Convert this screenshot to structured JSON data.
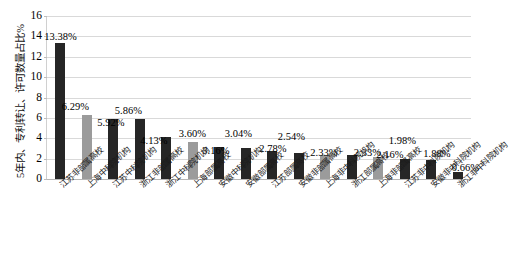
{
  "chart_data": {
    "type": "bar",
    "title": "",
    "subtitle": "",
    "xlabel": "",
    "ylabel": "5年内、专利转让、许可数量占比%",
    "ylim": [
      0,
      16
    ],
    "ytick_labels": [
      "0",
      "2",
      "4",
      "6",
      "8",
      "10",
      "12",
      "14",
      "16"
    ],
    "ytick_values": [
      0,
      2,
      4,
      6,
      8,
      10,
      12,
      14,
      16
    ],
    "grid": true,
    "legend": "none",
    "categories": [
      "江苏非部属高校",
      "上海中科院机构",
      "江苏中科院机构",
      "浙江非部属高校",
      "浙江中科院机构",
      "上海部属高校",
      "安徽中科院机构",
      "安徽部属高校",
      "江苏部属高校",
      "安徽非部属高校",
      "上海非中科院机构",
      "浙江部属高校",
      "上海非部属高校",
      "江苏非中科院机构",
      "安徽非中科院机构",
      "浙江非中科院机构"
    ],
    "values": [
      13.38,
      6.29,
      5.92,
      5.86,
      4.13,
      3.6,
      3.16,
      3.04,
      2.78,
      2.54,
      2.33,
      2.33,
      2.16,
      1.98,
      1.88,
      0.66
    ],
    "value_labels": [
      "13.38%",
      "6.29%",
      "5.92%",
      "5.86%",
      "4.13%",
      "3.60%",
      "3.16%",
      "3.04%",
      "2.78%",
      "2.54%",
      "2.33%",
      "2.33%",
      "2.16%",
      "1.98%",
      "1.88%",
      "0.66%"
    ],
    "bar_colors": [
      "#262626",
      "#9b9b9b",
      "#262626",
      "#262626",
      "#262626",
      "#9b9b9b",
      "#262626",
      "#262626",
      "#262626",
      "#262626",
      "#9b9b9b",
      "#262626",
      "#9b9b9b",
      "#262626",
      "#262626",
      "#262626"
    ],
    "colors": {
      "dark_bar": "#262626",
      "gray_bar": "#9b9b9b",
      "gridline": "#d9d9d9",
      "axis": "#b6b6b6",
      "text": "#000000",
      "background": "#ffffff"
    }
  }
}
